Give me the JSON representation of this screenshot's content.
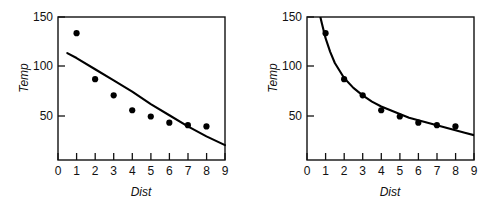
{
  "chart_data": [
    {
      "type": "scatter",
      "panel": "left",
      "title": "",
      "xlabel": "Dist",
      "ylabel": "Temp",
      "xlim": [
        0,
        9
      ],
      "ylim": [
        35,
        150
      ],
      "xticks": [
        0,
        1,
        2,
        3,
        4,
        5,
        6,
        7,
        8,
        9
      ],
      "xtick_labels": [
        "0",
        "1",
        "2",
        "3",
        "4",
        "5",
        "6",
        "7",
        "8",
        "9"
      ],
      "yticks": [
        50,
        100,
        150
      ],
      "ytick_labels": [
        "50",
        "100",
        "150"
      ],
      "grid": false,
      "legend": "none",
      "series": [
        {
          "name": "observed",
          "kind": "points",
          "x": [
            1,
            2,
            3,
            4,
            5,
            6,
            7,
            8
          ],
          "values": [
            137,
            100,
            87,
            75,
            70,
            65,
            63,
            62
          ]
        },
        {
          "name": "fitted-line",
          "kind": "line",
          "note": "shallow near-linear fit, underestimates first point and overestimates mid-range",
          "x": [
            0.5,
            1,
            2,
            3,
            4,
            5,
            6,
            7,
            8,
            9
          ],
          "values": [
            121,
            117,
            108,
            99,
            90,
            80,
            71,
            62,
            54,
            47
          ]
        }
      ]
    },
    {
      "type": "scatter",
      "panel": "right",
      "title": "",
      "xlabel": "Dist",
      "ylabel": "Temp",
      "xlim": [
        0,
        9
      ],
      "ylim": [
        35,
        150
      ],
      "xticks": [
        0,
        1,
        2,
        3,
        4,
        5,
        6,
        7,
        8,
        9
      ],
      "xtick_labels": [
        "0",
        "1",
        "2",
        "3",
        "4",
        "5",
        "6",
        "7",
        "8",
        "9"
      ],
      "yticks": [
        50,
        100,
        150
      ],
      "ytick_labels": [
        "50",
        "100",
        "150"
      ],
      "grid": false,
      "legend": "none",
      "series": [
        {
          "name": "observed",
          "kind": "points",
          "x": [
            1,
            2,
            3,
            4,
            5,
            6,
            7,
            8
          ],
          "values": [
            137,
            100,
            87,
            75,
            70,
            65,
            63,
            62
          ]
        },
        {
          "name": "fitted-curve",
          "kind": "line",
          "note": "steep power-law decay curve exiting top of frame near Dist 0.75",
          "x": [
            0.72,
            0.8,
            1,
            1.25,
            1.5,
            2,
            2.5,
            3,
            3.5,
            4,
            4.5,
            5,
            5.5,
            6,
            6.5,
            7,
            7.5,
            8,
            8.5,
            9
          ],
          "values": [
            150,
            145,
            133,
            122,
            113,
            101,
            93,
            87,
            82,
            78,
            75,
            72,
            69,
            67,
            65,
            63,
            61,
            59,
            57,
            55
          ]
        }
      ]
    }
  ],
  "panels": {
    "left": {
      "name": "left-plot",
      "xlabel": "Dist",
      "ylabel": "Temp",
      "ytick_labels": [
        "150",
        "100",
        "50"
      ],
      "xtick_labels": [
        "0",
        "1",
        "2",
        "3",
        "4",
        "5",
        "6",
        "7",
        "8",
        "9"
      ]
    },
    "right": {
      "name": "right-plot",
      "xlabel": "Dist",
      "ylabel": "Temp",
      "ytick_labels": [
        "150",
        "100",
        "50"
      ],
      "xtick_labels": [
        "0",
        "1",
        "2",
        "3",
        "4",
        "5",
        "6",
        "7",
        "8",
        "9"
      ]
    }
  },
  "colors": {
    "ink": "#111111",
    "point": "#000000",
    "line": "#000000",
    "background": "#ffffff"
  }
}
